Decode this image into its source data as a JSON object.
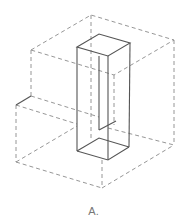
{
  "figure": {
    "label": "A.",
    "colors": {
      "background": "#ffffff",
      "solid_line": "#555555",
      "dashed_line": "#8a8a8a",
      "label": "#777777"
    },
    "outer_dashed_box": {
      "top_face": [
        [
          31,
          50
        ],
        [
          91,
          15
        ],
        [
          174,
          40
        ],
        [
          114,
          75
        ]
      ],
      "bottom_vertices": {
        "left": [
          16,
          162
        ],
        "front": [
          102,
          188
        ],
        "right": [
          174,
          145
        ]
      }
    },
    "solid_prism": {
      "top_face": [
        [
          77,
          47
        ],
        [
          99,
          34
        ],
        [
          130,
          43
        ],
        [
          108,
          56
        ]
      ],
      "bottom_face": [
        [
          77,
          151
        ],
        [
          99,
          138
        ],
        [
          129,
          147
        ],
        [
          108,
          160
        ]
      ]
    },
    "step_line": [
      [
        16,
        105
      ],
      [
        31,
        96
      ]
    ]
  }
}
